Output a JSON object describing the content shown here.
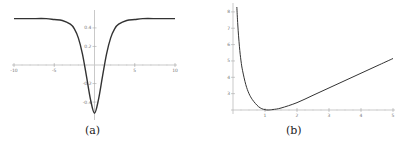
{
  "chart_data": [
    {
      "type": "line",
      "panel": "a",
      "caption": "(a)",
      "title": "",
      "xlabel": "",
      "ylabel": "",
      "xlim": [
        -10,
        10
      ],
      "ylim": [
        -0.55,
        0.55
      ],
      "xticks": [
        -10,
        -5,
        5,
        10
      ],
      "xtick_labels": [
        "-10",
        "-5",
        "5",
        "10"
      ],
      "yticks": [
        -0.4,
        -0.2,
        0.2,
        0.4
      ],
      "ytick_labels": [
        "-0.4",
        "-0.2",
        "0.2",
        "0.4"
      ],
      "grid": false,
      "legend": null,
      "series": [
        {
          "name": "curve",
          "x": [
            -10,
            -8,
            -6,
            -5,
            -4,
            -3,
            -2.5,
            -2,
            -1.5,
            -1,
            -0.5,
            0,
            0.5,
            1,
            1.5,
            2,
            2.5,
            3,
            4,
            5,
            6,
            8,
            10
          ],
          "y": [
            0.5,
            0.5,
            0.5,
            0.49,
            0.48,
            0.44,
            0.39,
            0.29,
            0.12,
            -0.12,
            -0.37,
            -0.52,
            -0.37,
            -0.12,
            0.12,
            0.29,
            0.39,
            0.44,
            0.48,
            0.49,
            0.5,
            0.5,
            0.5
          ]
        }
      ]
    },
    {
      "type": "line",
      "panel": "b",
      "caption": "(b)",
      "title": "",
      "xlabel": "",
      "ylabel": "",
      "xlim": [
        0,
        5
      ],
      "ylim": [
        2,
        8.3
      ],
      "xticks": [
        1,
        2,
        3,
        4,
        5
      ],
      "xtick_labels": [
        "1",
        "2",
        "3",
        "4",
        "5"
      ],
      "yticks": [
        3,
        4,
        5,
        6,
        7,
        8
      ],
      "ytick_labels": [
        "3",
        "4",
        "5",
        "6",
        "7",
        "8"
      ],
      "grid": false,
      "legend": null,
      "series": [
        {
          "name": "curve",
          "x": [
            0.12,
            0.15,
            0.2,
            0.25,
            0.3,
            0.4,
            0.5,
            0.6,
            0.7,
            0.8,
            0.9,
            1.0,
            1.1,
            1.25,
            1.5,
            2.0,
            2.5,
            3.0,
            3.5,
            4.0,
            4.5,
            5.0
          ],
          "y": [
            8.3,
            7.2,
            5.9,
            5.0,
            4.4,
            3.55,
            3.0,
            2.65,
            2.4,
            2.2,
            2.08,
            2.02,
            2.0,
            2.03,
            2.12,
            2.45,
            2.9,
            3.35,
            3.8,
            4.25,
            4.7,
            5.15
          ]
        }
      ]
    }
  ],
  "captions": {
    "a": "(a)",
    "b": "(b)"
  }
}
